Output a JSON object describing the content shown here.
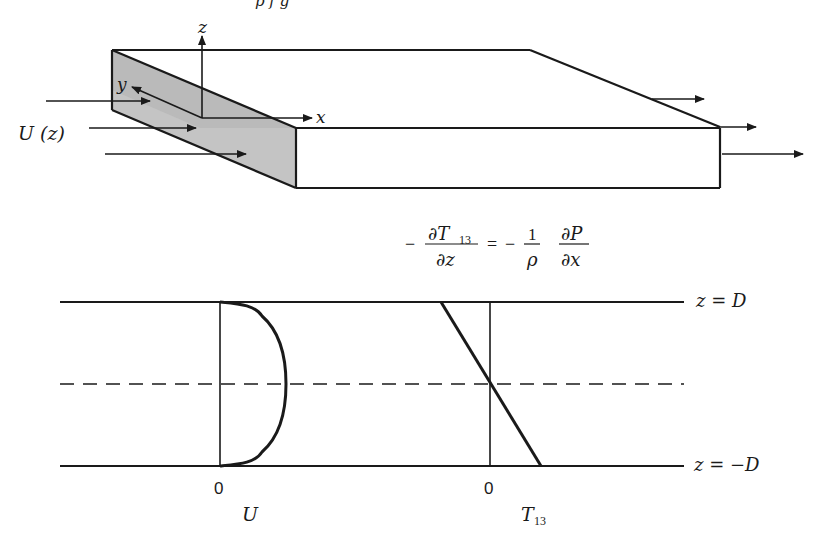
{
  "diagram": {
    "title_partial": "p  f      g",
    "box_labels": {
      "z_axis": "z",
      "y_axis": "y",
      "x_axis": "x",
      "inflow": "U (z)"
    },
    "equation": {
      "lhs_sign": "−",
      "lhs_num": "∂T",
      "lhs_num_sub": "13",
      "lhs_den": "∂z",
      "equals": "=",
      "rhs_sign": "−",
      "rhs_frac1_num": "1",
      "rhs_frac1_den": "ρ",
      "rhs_frac2_num": "∂P",
      "rhs_frac2_den": "∂x"
    },
    "profile": {
      "top_label": "z = D",
      "bottom_label": "z = −D",
      "u_zero": "0",
      "u_label": "U",
      "t_zero": "0",
      "t_label": "T",
      "t_label_sub": "13"
    },
    "colors": {
      "line": "#1a1a1a",
      "face_shade": "#c8c8c8",
      "face_shade_dark": "#b4b4b4",
      "background": "#ffffff"
    }
  }
}
